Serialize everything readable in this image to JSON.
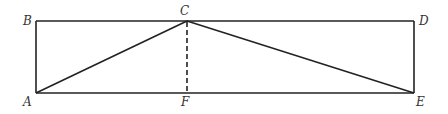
{
  "diagram": {
    "type": "geometry",
    "colors": {
      "stroke": "#222222",
      "label": "#333333",
      "background": "#ffffff"
    },
    "points": {
      "A": {
        "label": "A",
        "x": 36,
        "y": 93
      },
      "B": {
        "label": "B",
        "x": 36,
        "y": 21
      },
      "C": {
        "label": "C",
        "x": 187,
        "y": 21
      },
      "D": {
        "label": "D",
        "x": 414,
        "y": 21
      },
      "E": {
        "label": "E",
        "x": 414,
        "y": 93
      },
      "F": {
        "label": "F",
        "x": 187,
        "y": 93
      }
    },
    "segments": [
      {
        "from": "B",
        "to": "D",
        "style": "solid"
      },
      {
        "from": "A",
        "to": "E",
        "style": "solid"
      },
      {
        "from": "A",
        "to": "B",
        "style": "solid"
      },
      {
        "from": "D",
        "to": "E",
        "style": "solid"
      },
      {
        "from": "A",
        "to": "C",
        "style": "solid"
      },
      {
        "from": "C",
        "to": "E",
        "style": "solid"
      },
      {
        "from": "C",
        "to": "F",
        "style": "dashed"
      }
    ]
  }
}
